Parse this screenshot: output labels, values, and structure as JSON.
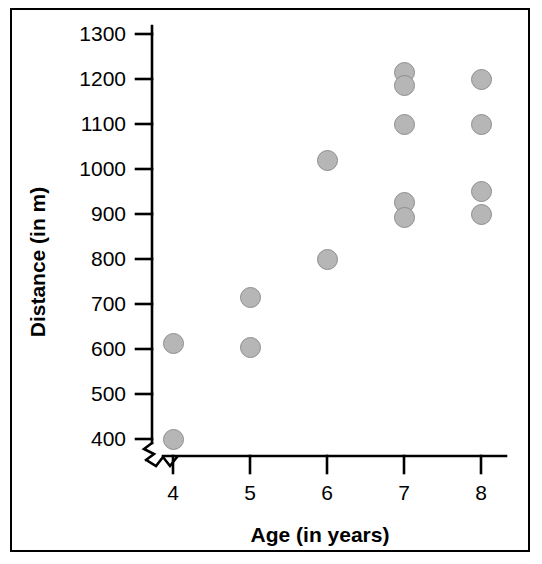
{
  "chart_data": {
    "type": "scatter",
    "title": "",
    "xlabel": "Age (in years)",
    "ylabel": "Distance (in m)",
    "x_ticks": [
      4,
      5,
      6,
      7,
      8
    ],
    "x_tick_labels": [
      "4",
      "5",
      "6",
      "7",
      "8"
    ],
    "y_ticks": [
      400,
      500,
      600,
      700,
      800,
      900,
      1000,
      1100,
      1200,
      1300
    ],
    "y_tick_labels": [
      "400",
      "500",
      "600",
      "700",
      "800",
      "900",
      "1000",
      "1100",
      "1200",
      "1300"
    ],
    "xlim": [
      3.6,
      8.4
    ],
    "ylim": [
      400,
      1300
    ],
    "y_axis_break": true,
    "x_axis_break": true,
    "grid": false,
    "legend": false,
    "marker": {
      "shape": "circle",
      "fill_color": "#b6b6b6",
      "edge_color": "#8d8d8d",
      "diameter_px": 21
    },
    "points": [
      {
        "x": 4,
        "y": 613
      },
      {
        "x": 4,
        "y": 400
      },
      {
        "x": 5,
        "y": 715
      },
      {
        "x": 5,
        "y": 603
      },
      {
        "x": 6,
        "y": 1020
      },
      {
        "x": 6,
        "y": 800
      },
      {
        "x": 7,
        "y": 1215
      },
      {
        "x": 7,
        "y": 1185
      },
      {
        "x": 7,
        "y": 1100
      },
      {
        "x": 7,
        "y": 925
      },
      {
        "x": 7,
        "y": 893
      },
      {
        "x": 8,
        "y": 1200
      },
      {
        "x": 8,
        "y": 1100
      },
      {
        "x": 8,
        "y": 950
      },
      {
        "x": 8,
        "y": 900
      }
    ]
  }
}
